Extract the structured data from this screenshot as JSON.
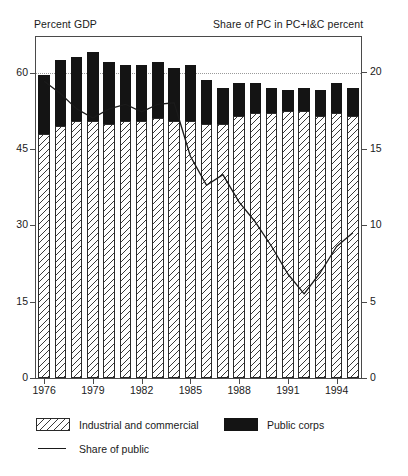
{
  "chart_data": {
    "type": "bar",
    "title": "",
    "subtitle": "",
    "left_axis_title": "Percent GDP",
    "right_axis_title": "Share of PC in PC+I&C percent",
    "xlabel": "",
    "ylabel": "Percent GDP",
    "y2label": "Share of PC in PC+I&C percent",
    "ylim": [
      0,
      67
    ],
    "y2lim": [
      0,
      22.3
    ],
    "yticks": [
      0,
      15,
      30,
      45,
      60
    ],
    "y2ticks": [
      0,
      5,
      10,
      15,
      20
    ],
    "grid": "dotted horizontal gridline at left 60 / right 20",
    "legend_position": "below-plot-left",
    "stacked": true,
    "categories": [
      "1976",
      "1977",
      "1978",
      "1979",
      "1980",
      "1981",
      "1982",
      "1983",
      "1984",
      "1985",
      "1986",
      "1987",
      "1988",
      "1989",
      "1990",
      "1991",
      "1992",
      "1993",
      "1994",
      "1995"
    ],
    "xtick_labels": [
      "1976",
      "1979",
      "1982",
      "1985",
      "1988",
      "1991",
      "1994"
    ],
    "series": [
      {
        "name": "Industrial and commercial",
        "type": "bar-segment",
        "pattern": "diagonal-hatch",
        "color": "#ffffff",
        "values": [
          48.0,
          49.5,
          50.5,
          50.5,
          50.0,
          50.5,
          50.5,
          51.0,
          50.5,
          50.5,
          50.0,
          50.0,
          51.5,
          52.0,
          52.0,
          52.5,
          52.5,
          51.5,
          52.0,
          51.5
        ]
      },
      {
        "name": "Public corps",
        "type": "bar-segment",
        "pattern": "solid",
        "color": "#141414",
        "values": [
          11.5,
          13.0,
          12.5,
          13.5,
          12.0,
          11.0,
          11.0,
          11.0,
          10.5,
          11.0,
          8.5,
          7.0,
          6.5,
          6.0,
          5.0,
          4.0,
          4.5,
          5.0,
          6.0,
          5.5
        ]
      },
      {
        "name": "Share of public",
        "type": "line",
        "axis": "right",
        "color": "#1a1a1a",
        "values": [
          19.4,
          18.6,
          17.6,
          17.0,
          17.6,
          17.9,
          17.4,
          17.9,
          18.0,
          14.5,
          12.6,
          13.3,
          11.5,
          10.2,
          8.6,
          6.8,
          5.5,
          6.9,
          8.6,
          9.5
        ]
      }
    ],
    "legend": [
      {
        "label": "Industrial and commercial",
        "swatch": "hatch"
      },
      {
        "label": "Public corps",
        "swatch": "black"
      },
      {
        "label": "Share of public",
        "swatch": "line"
      }
    ]
  }
}
